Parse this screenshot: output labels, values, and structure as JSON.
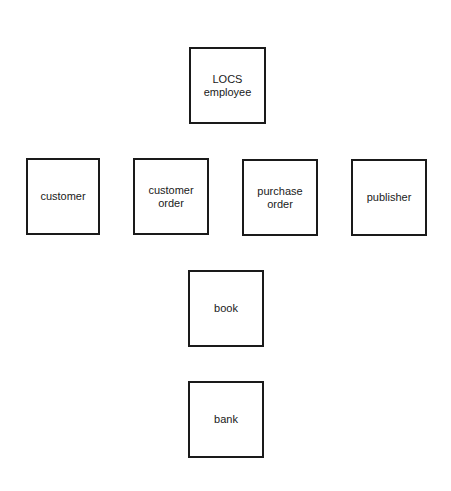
{
  "diagram": {
    "entities": [
      {
        "id": "locs-employee",
        "label": "LOCS\nemployee"
      },
      {
        "id": "customer",
        "label": "customer"
      },
      {
        "id": "customer-order",
        "label": "customer\norder"
      },
      {
        "id": "purchase-order",
        "label": "purchase\norder"
      },
      {
        "id": "publisher",
        "label": "publisher"
      },
      {
        "id": "book",
        "label": "book"
      },
      {
        "id": "bank",
        "label": "bank"
      }
    ]
  }
}
